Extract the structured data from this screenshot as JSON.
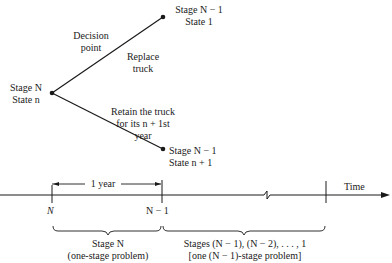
{
  "tree": {
    "decision_point_label": [
      "Decision",
      "point"
    ],
    "root": {
      "stage": "Stage N",
      "state": "State n"
    },
    "upper_branch": {
      "action": [
        "Replace",
        "truck"
      ],
      "stage": "Stage N − 1",
      "state": "State 1"
    },
    "lower_branch": {
      "action": [
        "Retain the truck",
        "for its n + 1st",
        "year"
      ],
      "stage": "Stage N − 1",
      "state": "State n + 1"
    }
  },
  "timeline": {
    "axis_label": "Time",
    "interval_label": "1 year",
    "ticks": [
      "N",
      "N − 1"
    ],
    "brace_left": [
      "Stage N",
      "(one-stage problem)"
    ],
    "brace_right": [
      "Stages (N − 1), (N − 2), . . . , 1",
      "[one (N − 1)-stage problem]"
    ]
  },
  "colors": {
    "ink": "#1a1a1a",
    "background": "#ffffff"
  }
}
